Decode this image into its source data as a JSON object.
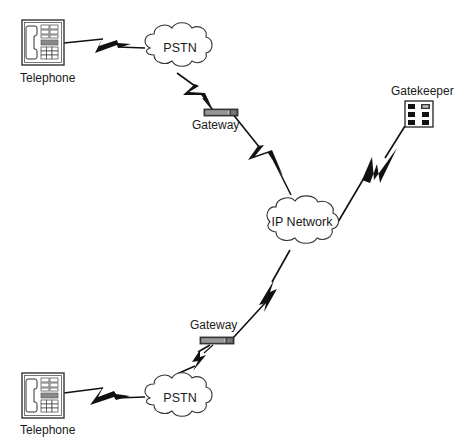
{
  "diagram": {
    "title": "",
    "colors": {
      "line": "#111111",
      "background": "#ffffff",
      "outline": "#333333"
    },
    "nodes": [
      {
        "id": "tel_top",
        "type": "telephone",
        "label": "Telephone"
      },
      {
        "id": "pstn_top",
        "type": "cloud",
        "label": "PSTN"
      },
      {
        "id": "gw_top",
        "type": "gateway",
        "label": "Gateway"
      },
      {
        "id": "ipnet",
        "type": "cloud",
        "label": "IP Network"
      },
      {
        "id": "gk",
        "type": "gatekeeper",
        "label": "Gatekeeper"
      },
      {
        "id": "gw_bottom",
        "type": "gateway",
        "label": "Gateway"
      },
      {
        "id": "pstn_bottom",
        "type": "cloud",
        "label": "PSTN"
      },
      {
        "id": "tel_bottom",
        "type": "telephone",
        "label": "Telephone"
      }
    ],
    "links": [
      {
        "from": "tel_top",
        "to": "pstn_top",
        "style": "lightning"
      },
      {
        "from": "pstn_top",
        "to": "gw_top",
        "style": "lightning"
      },
      {
        "from": "gw_top",
        "to": "ipnet",
        "style": "lightning"
      },
      {
        "from": "ipnet",
        "to": "gk",
        "style": "lightning"
      },
      {
        "from": "ipnet",
        "to": "gw_bottom",
        "style": "lightning"
      },
      {
        "from": "gw_bottom",
        "to": "pstn_bottom",
        "style": "lightning"
      },
      {
        "from": "pstn_bottom",
        "to": "tel_bottom",
        "style": "lightning"
      }
    ]
  },
  "labels": {
    "tel_top": "Telephone",
    "pstn_top": "PSTN",
    "gw_top": "Gateway",
    "gatekeeper": "Gatekeeper",
    "ipnet": "IP Network",
    "gw_bottom": "Gateway",
    "pstn_bottom": "PSTN",
    "tel_bottom": "Telephone"
  }
}
